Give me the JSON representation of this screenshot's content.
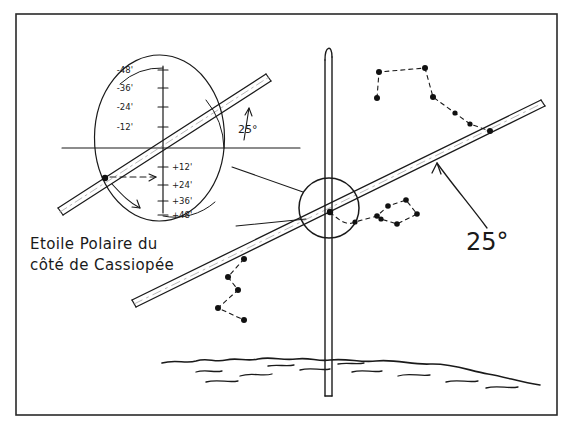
{
  "figure": {
    "background": "#ffffff",
    "ink": "#1a1a1a",
    "frame": {
      "x": 16,
      "y": 14,
      "width": 541,
      "height": 401
    }
  },
  "annotations": {
    "caption_line1": "Etoile Polaire du",
    "caption_line2": "côté de Cassiopée",
    "angle_big": "25°",
    "angle_inset": "25°"
  },
  "scale": {
    "label_note": "declination minutes scale inside magnifier inset",
    "negative": [
      "-48'",
      "-36'",
      "-24'",
      "-12'"
    ],
    "positive": [
      "+12'",
      "+24'",
      "+36'",
      "+48'"
    ]
  },
  "constellations": {
    "big_dipper": {
      "name": "Grande Ourse",
      "points": [
        [
          377,
          98
        ],
        [
          379,
          72
        ],
        [
          425,
          68
        ],
        [
          433,
          97
        ],
        [
          455,
          113
        ],
        [
          470,
          124
        ],
        [
          490,
          131
        ]
      ]
    },
    "cassiopeia": {
      "name": "Cassiopée",
      "points": [
        [
          244,
          259
        ],
        [
          228,
          277
        ],
        [
          238,
          290
        ],
        [
          218,
          308
        ],
        [
          244,
          320
        ]
      ]
    },
    "little_dipper": {
      "name": "Petite Ourse",
      "points": [
        [
          330,
          212
        ],
        [
          355,
          222
        ],
        [
          377,
          216
        ],
        [
          388,
          206
        ],
        [
          406,
          200
        ],
        [
          417,
          214
        ],
        [
          397,
          224
        ],
        [
          381,
          219
        ]
      ]
    }
  },
  "elements": {
    "mast_name": "vertical mast pole with hooked top",
    "magnifier_name": "magnified circle over Polaris",
    "inset_name": "enlarged detail circle",
    "horizon_name": "wavy ground horizon line",
    "band_name": "alignment sighting band"
  }
}
